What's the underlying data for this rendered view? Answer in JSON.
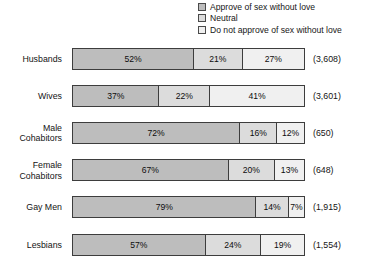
{
  "chart_data": {
    "type": "bar",
    "subtype": "horizontal-100-percent-stacked",
    "title": "",
    "xlabel": "",
    "ylabel": "",
    "xlim": [
      0,
      100
    ],
    "grid": false,
    "legend_position": "top-right",
    "categories": [
      "Husbands",
      "Wives",
      "Male Cohabitors",
      "Female Cohabitors",
      "Gay Men",
      "Lesbians"
    ],
    "series": [
      {
        "name": "Approve of sex without love",
        "values": [
          52,
          37,
          72,
          67,
          79,
          57
        ]
      },
      {
        "name": "Neutral",
        "values": [
          21,
          22,
          16,
          20,
          14,
          24
        ]
      },
      {
        "name": "Do not approve of sex without love",
        "values": [
          27,
          41,
          12,
          13,
          7,
          19
        ]
      }
    ],
    "counts": [
      "(3,608)",
      "(3,601)",
      "(650)",
      "(648)",
      "(1,915)",
      "(1,554)"
    ],
    "colors": {
      "approve": "#bdbdbd",
      "neutral": "#dcdcdc",
      "disapprove": "#f0f0f0",
      "outline": "#3d3d3d"
    }
  },
  "legend": {
    "items": [
      {
        "label": "Approve of sex without love",
        "swatch": "approve-swatch"
      },
      {
        "label": "Neutral",
        "swatch": "neutral-swatch"
      },
      {
        "label": "Do not approve of sex without love",
        "swatch": "disapprove-swatch"
      }
    ]
  },
  "rows": [
    {
      "label_line1": "Husbands",
      "label_line2": "",
      "count": "(3,608)",
      "segments": [
        {
          "label": "52%",
          "pct": 52
        },
        {
          "label": "21%",
          "pct": 21
        },
        {
          "label": "27%",
          "pct": 27
        }
      ]
    },
    {
      "label_line1": "Wives",
      "label_line2": "",
      "count": "(3,601)",
      "segments": [
        {
          "label": "37%",
          "pct": 37
        },
        {
          "label": "22%",
          "pct": 22
        },
        {
          "label": "41%",
          "pct": 41
        }
      ]
    },
    {
      "label_line1": "Male",
      "label_line2": "Cohabitors",
      "count": "(650)",
      "segments": [
        {
          "label": "72%",
          "pct": 72
        },
        {
          "label": "16%",
          "pct": 16
        },
        {
          "label": "12%",
          "pct": 12
        }
      ]
    },
    {
      "label_line1": "Female",
      "label_line2": "Cohabitors",
      "count": "(648)",
      "segments": [
        {
          "label": "67%",
          "pct": 67
        },
        {
          "label": "20%",
          "pct": 20
        },
        {
          "label": "13%",
          "pct": 13
        }
      ]
    },
    {
      "label_line1": "Gay Men",
      "label_line2": "",
      "count": "(1,915)",
      "segments": [
        {
          "label": "79%",
          "pct": 79
        },
        {
          "label": "14%",
          "pct": 14
        },
        {
          "label": "7%",
          "pct": 7
        }
      ]
    },
    {
      "label_line1": "Lesbians",
      "label_line2": "",
      "count": "(1,554)",
      "segments": [
        {
          "label": "57%",
          "pct": 57
        },
        {
          "label": "24%",
          "pct": 24
        },
        {
          "label": "19%",
          "pct": 19
        }
      ]
    }
  ]
}
